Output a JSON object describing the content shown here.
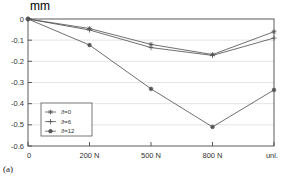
{
  "chart_data": {
    "type": "line",
    "title": "",
    "subtitle": "",
    "xlabel": "",
    "ylabel": "mm",
    "ylabel_position": "top-left",
    "categories": [
      "0",
      "200 N",
      "500 N",
      "800 N",
      "unl."
    ],
    "ylim": [
      -0.6,
      0.0
    ],
    "yticks": [
      "0",
      "-0.1",
      "-0.2",
      "-0.3",
      "-0.4",
      "-0.5",
      "-0.6"
    ],
    "ytick_values": [
      0,
      -0.1,
      -0.2,
      -0.3,
      -0.4,
      -0.5,
      -0.6
    ],
    "grid": true,
    "grid_axis": "y",
    "legend_position": "lower-left-inside",
    "series": [
      {
        "name": "ϑ=0",
        "marker": "asterisk",
        "color": "#555555",
        "values": [
          0.0,
          -0.045,
          -0.12,
          -0.168,
          -0.06
        ]
      },
      {
        "name": "ϑ=6",
        "marker": "plus",
        "color": "#555555",
        "values": [
          0.0,
          -0.052,
          -0.135,
          -0.172,
          -0.09
        ]
      },
      {
        "name": "ϑ=12",
        "marker": "dot",
        "color": "#555555",
        "values": [
          0.0,
          -0.123,
          -0.33,
          -0.51,
          -0.335
        ]
      }
    ]
  },
  "figure": {
    "caption": "(a)",
    "unit_label": "mm"
  },
  "legend": {
    "entries": [
      {
        "label": "ϑ=0"
      },
      {
        "label": "ϑ=6"
      },
      {
        "label": "ϑ=12"
      }
    ]
  }
}
